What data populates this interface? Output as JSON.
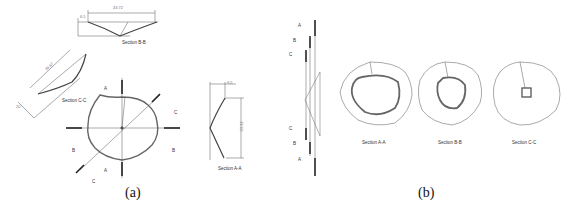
{
  "figure": {
    "panels": [
      {
        "id": "a",
        "caption": "(a)",
        "views": {
          "section_bb": {
            "label": "Section B-B",
            "width_dim": "43.72",
            "height_dim": "6.5"
          },
          "section_cc": {
            "label": "Section C-C",
            "length_dim": "39.87",
            "offset_dim": "20"
          },
          "section_aa": {
            "label": "Section A-A",
            "width_dim": "9.5",
            "height_dim": "43.32"
          },
          "plan": {
            "cut_marks": [
              "A",
              "A",
              "B",
              "B",
              "C",
              "C"
            ]
          }
        }
      },
      {
        "id": "b",
        "caption": "(b)",
        "side_view": {
          "cut_marks": [
            "A",
            "B",
            "C",
            "C",
            "B",
            "A"
          ]
        },
        "sections": [
          {
            "label": "Section A-A"
          },
          {
            "label": "Section B-B"
          },
          {
            "label": "Section C-C"
          }
        ]
      }
    ]
  }
}
